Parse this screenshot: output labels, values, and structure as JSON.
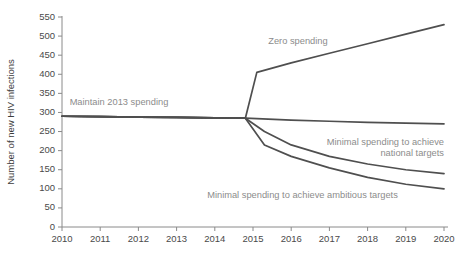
{
  "chart_data": {
    "type": "line",
    "title": "",
    "xlabel": "",
    "ylabel": "Number of new HIV infections",
    "xlim": [
      2010,
      2020
    ],
    "ylim": [
      0,
      550
    ],
    "grid": false,
    "legend_position": "inline-annotations",
    "x_ticks": [
      "2010",
      "2011",
      "2012",
      "2013",
      "2014",
      "2015",
      "2016",
      "2017",
      "2018",
      "2019",
      "2020"
    ],
    "y_ticks": [
      "0",
      "50",
      "100",
      "150",
      "200",
      "250",
      "300",
      "350",
      "400",
      "450",
      "500",
      "550"
    ],
    "series": [
      {
        "name": "Zero spending",
        "label": "Zero spending",
        "x": [
          2010,
          2011,
          2012,
          2013,
          2014,
          2014.8,
          2015.1,
          2016,
          2017,
          2018,
          2019,
          2020
        ],
        "values": [
          290,
          289,
          288,
          287,
          286,
          285,
          405,
          430,
          455,
          480,
          505,
          530
        ]
      },
      {
        "name": "Maintain 2013 spending",
        "label": "Maintain 2013 spending",
        "x": [
          2010,
          2011,
          2012,
          2013,
          2014,
          2014.8,
          2016,
          2017,
          2018,
          2019,
          2020
        ],
        "values": [
          290,
          289,
          288,
          287,
          286,
          285,
          280,
          277,
          274,
          272,
          270
        ]
      },
      {
        "name": "Minimal spending to achieve national targets",
        "label": "Minimal spending to achieve national targets",
        "x": [
          2010,
          2011,
          2012,
          2013,
          2014,
          2014.8,
          2015.3,
          2016,
          2017,
          2018,
          2019,
          2020
        ],
        "values": [
          290,
          289,
          288,
          287,
          286,
          285,
          250,
          215,
          185,
          165,
          150,
          140
        ]
      },
      {
        "name": "Minimal spending to achieve ambitious targets",
        "label": "Minimal spending to achieve ambitious targets",
        "x": [
          2010,
          2011,
          2012,
          2013,
          2014,
          2014.8,
          2015.3,
          2016,
          2017,
          2018,
          2019,
          2020
        ],
        "values": [
          290,
          289,
          288,
          287,
          286,
          285,
          215,
          185,
          155,
          130,
          112,
          100
        ]
      }
    ],
    "annotations": [
      {
        "name": "zero-spending",
        "text": "Zero spending",
        "x": 2015.4,
        "y": 480,
        "align": "start"
      },
      {
        "name": "maintain-2013-spending",
        "text": "Maintain 2013 spending",
        "x": 2010.2,
        "y": 320,
        "align": "start"
      },
      {
        "name": "national-targets-line1",
        "text": "Minimal spending to achieve",
        "x": 2020,
        "y": 215,
        "align": "end"
      },
      {
        "name": "national-targets-line2",
        "text": "national targets",
        "x": 2020,
        "y": 187,
        "align": "end"
      },
      {
        "name": "ambitious-targets",
        "text": "Minimal spending to achieve ambitious targets",
        "x": 2013.8,
        "y": 75,
        "align": "start"
      }
    ],
    "colors": {
      "line": "#4f4f4f",
      "axis": "#8a8a8a",
      "tick_label": "#4a4a4a",
      "annotation": "#8c8c8c",
      "background": "#ffffff"
    }
  }
}
